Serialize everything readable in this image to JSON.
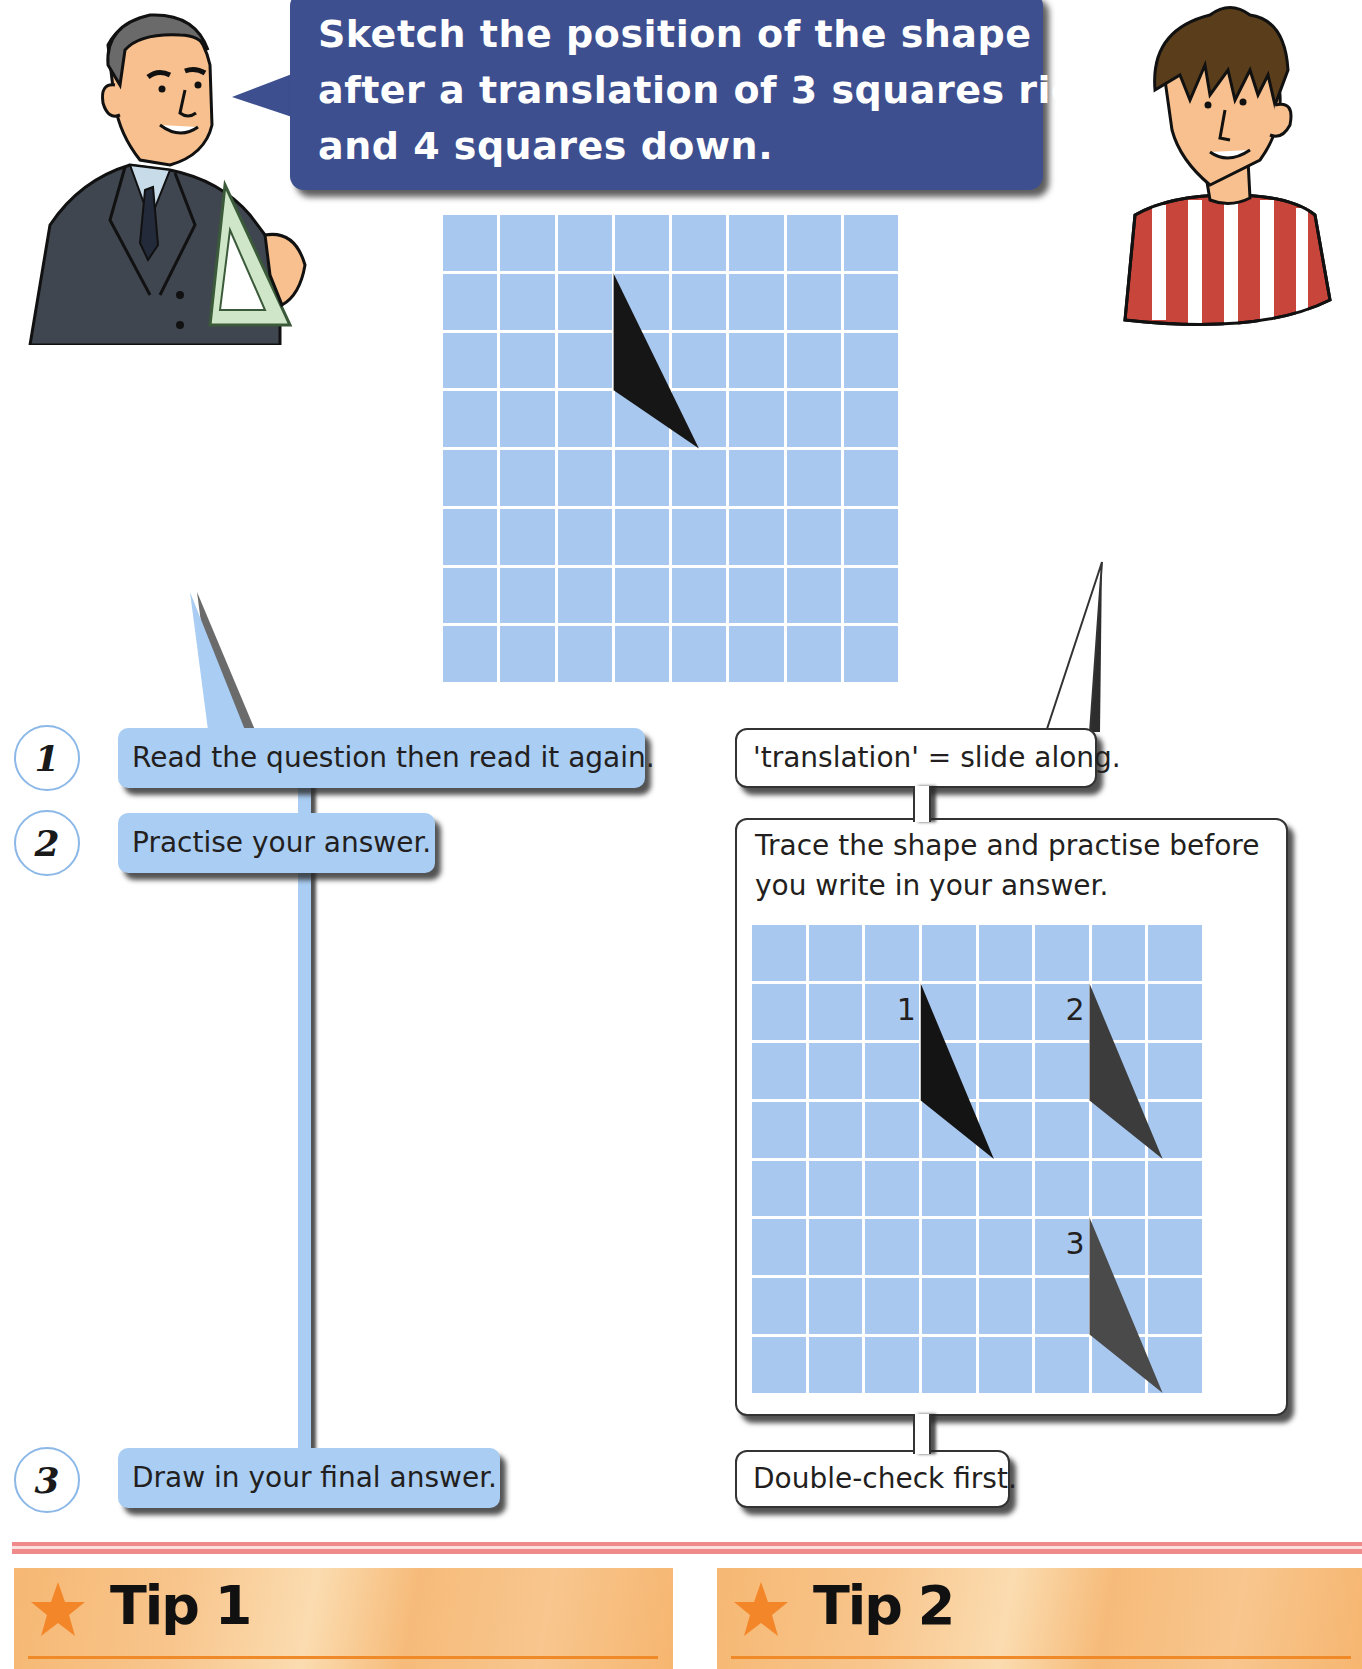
{
  "teacher_bubble": {
    "lines": [
      "Sketch the position of the shape",
      "after a translation of 3 squares right",
      "and 4 squares down."
    ]
  },
  "characters": {
    "teacher": "teacher-with-set-square",
    "student": "boy-in-striped-shirt"
  },
  "question_grid": {
    "columns": 8,
    "rows": 8,
    "shape": "triangle",
    "vertices": [
      [
        3,
        1
      ],
      [
        3,
        3
      ],
      [
        4.5,
        4
      ]
    ]
  },
  "steps": [
    {
      "number": "1",
      "text": "Read the question then read it again."
    },
    {
      "number": "2",
      "text": "Practise your answer."
    },
    {
      "number": "3",
      "text": "Draw in your final answer."
    }
  ],
  "hints": {
    "translation": "'translation' = slide along.",
    "trace": "Trace the shape and practise before you write in your answer.",
    "double_check": "Double-check first."
  },
  "practice_grid": {
    "columns": 8,
    "rows": 8,
    "labels": [
      {
        "text": "1",
        "col": 2.5,
        "row": 1
      },
      {
        "text": "2",
        "col": 5.5,
        "row": 1
      },
      {
        "text": "3",
        "col": 5.5,
        "row": 5
      }
    ],
    "shapes": [
      {
        "label": "1",
        "vertices": [
          [
            3,
            1
          ],
          [
            3,
            3
          ],
          [
            4.3,
            4
          ]
        ],
        "color": "#141414"
      },
      {
        "label": "2",
        "vertices": [
          [
            6,
            1
          ],
          [
            6,
            3
          ],
          [
            7.3,
            4
          ]
        ],
        "color": "#3c3c3c"
      },
      {
        "label": "3",
        "vertices": [
          [
            6,
            5
          ],
          [
            6,
            7
          ],
          [
            7.3,
            8
          ]
        ],
        "color": "#4a4a4a"
      }
    ]
  },
  "tips": [
    {
      "title": "Tip 1"
    },
    {
      "title": "Tip 2"
    }
  ],
  "colors": {
    "bubble_blue": "#3d4f8f",
    "grid_cell": "#a8c8f0",
    "step_box": "#a9cdf3",
    "divider_pink": "#f08a8a",
    "tip_orange": "#f6b873",
    "star_orange": "#f4862a"
  }
}
